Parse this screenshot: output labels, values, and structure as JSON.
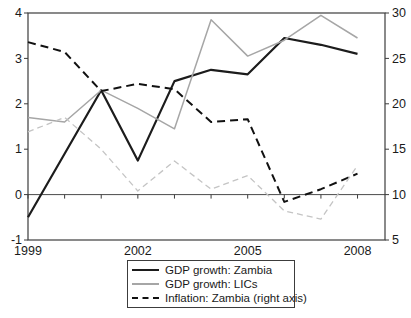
{
  "chart_data": {
    "type": "line",
    "title": "",
    "x_label": "",
    "x": [
      1999,
      2000,
      2001,
      2002,
      2003,
      2004,
      2005,
      2006,
      2007,
      2008
    ],
    "x_range": [
      1999,
      2008.75
    ],
    "x_tick_years": [
      1999,
      2000,
      2001,
      2002,
      2003,
      2004,
      2005,
      2006,
      2007,
      2008
    ],
    "x_label_years": [
      1999,
      2002,
      2005,
      2008
    ],
    "x_tick_labels": [
      "1999",
      "2002",
      "2005",
      "2008"
    ],
    "left_axis": {
      "min": -1,
      "max": 4,
      "ticks": [
        4,
        3,
        2,
        1,
        0,
        -1
      ]
    },
    "right_axis": {
      "min": 5,
      "max": 30,
      "ticks": [
        30,
        25,
        20,
        15,
        10,
        5
      ]
    },
    "baseline_left_value": 0,
    "grid": false,
    "legend_position": "bottom-center",
    "series": [
      {
        "label": "GDP growth: Zambia",
        "axis": "left",
        "color": "#1c1c1c",
        "width": 2.2,
        "dash": "",
        "in_legend": true,
        "values": [
          -0.5,
          0.9,
          2.3,
          0.75,
          2.5,
          2.75,
          2.65,
          3.45,
          3.3,
          3.1
        ]
      },
      {
        "label": "GDP growth: LICs",
        "axis": "left",
        "color": "#a6a6a6",
        "width": 1.5,
        "dash": "",
        "in_legend": true,
        "values": [
          1.7,
          1.6,
          2.3,
          1.9,
          1.45,
          3.85,
          3.05,
          3.4,
          3.95,
          3.45
        ]
      },
      {
        "label": "Inflation: Zambia (right axis)",
        "axis": "right",
        "color": "#111111",
        "width": 2,
        "dash": "8,5",
        "in_legend": true,
        "values": [
          26.8,
          25.7,
          21.4,
          22.2,
          21.6,
          18.0,
          18.3,
          9.2,
          10.6,
          12.3
        ]
      },
      {
        "label": "",
        "axis": "right",
        "color": "#c4c4c4",
        "width": 1.3,
        "dash": "6,4",
        "in_legend": false,
        "values": [
          16.9,
          18.5,
          15.0,
          10.4,
          13.7,
          10.6,
          12.1,
          8.2,
          7.3,
          13.2
        ]
      }
    ]
  }
}
